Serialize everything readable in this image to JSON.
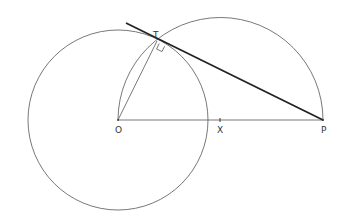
{
  "diagram": {
    "labels": {
      "O": "O",
      "X": "X",
      "P": "P",
      "T": "T"
    },
    "points": {
      "O": [
        118,
        120
      ],
      "X": [
        220,
        120
      ],
      "P": [
        323,
        120
      ],
      "T": [
        157,
        41
      ]
    },
    "circle_O_radius": 90,
    "semicircle_X_radius": 103,
    "colors": {
      "thin_line": "#555555",
      "tangent_line": "#222222",
      "text": "#333333"
    }
  }
}
